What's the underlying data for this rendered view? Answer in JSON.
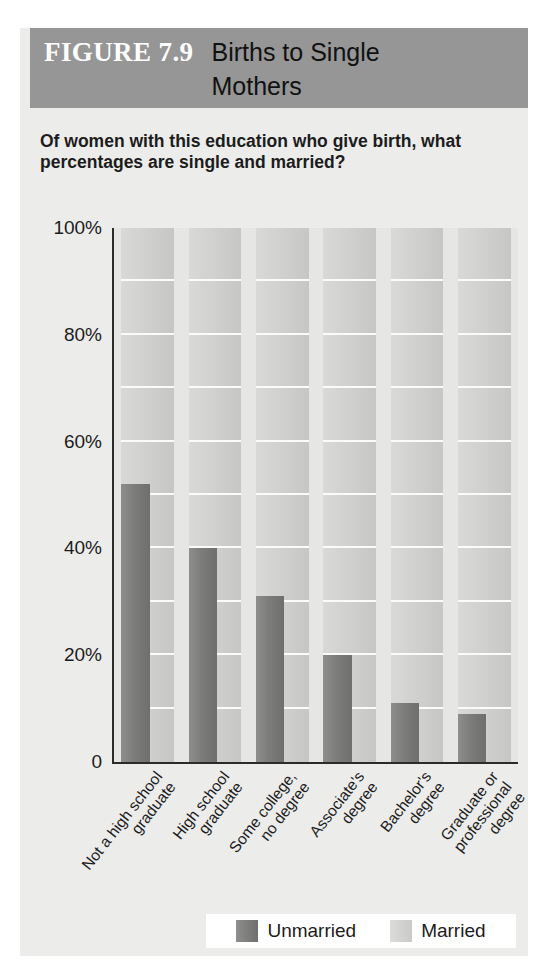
{
  "figure": {
    "number_label": "FIGURE 7.9",
    "title": "Births to Single Mothers",
    "subtitle": "Of women with this education who give birth, what percentages are single and married?"
  },
  "legend": {
    "entries": [
      {
        "label": "Unmarried",
        "color": "#7c7c7a",
        "swatch": "unmarried"
      },
      {
        "label": "Married",
        "color": "#cfcfcd",
        "swatch": "married"
      }
    ]
  },
  "colors": {
    "header_band": "#969696",
    "figure_background": "#ececeb",
    "plot_background": "#e6e6e4",
    "unmarried_bar": "#7c7c7a",
    "married_bar": "#cfcfcd",
    "gridline": "#fbfbfb",
    "axis": "#2b2b2b"
  },
  "chart_data": {
    "type": "bar",
    "title": "Births to Single Mothers",
    "subtitle": "Of women with this education who give birth, what percentages are single and married?",
    "xlabel": "",
    "ylabel": "",
    "ylim": [
      0,
      100
    ],
    "yticks": [
      "0",
      "20%",
      "40%",
      "60%",
      "80%",
      "100%"
    ],
    "ytick_values": [
      0,
      20,
      40,
      60,
      80,
      100
    ],
    "gridlines": true,
    "gridline_interval": 10,
    "legend_position": "bottom",
    "categories": [
      "Not a high school graduate",
      "High school graduate",
      "Some college, no degree",
      "Associate's degree",
      "Bachelor's degree",
      "Graduate or professional degree"
    ],
    "series": [
      {
        "name": "Unmarried",
        "values": [
          52,
          40,
          31,
          20,
          11,
          9
        ]
      },
      {
        "name": "Married",
        "values": [
          100,
          100,
          100,
          100,
          100,
          100
        ]
      }
    ]
  }
}
